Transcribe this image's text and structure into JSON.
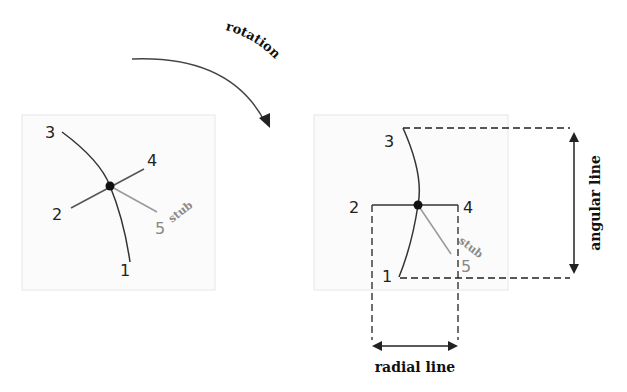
{
  "diagram": {
    "title_arrow_label": "rotation",
    "colors": {
      "line": "#333333",
      "stub_line": "#999999",
      "box_border": "#e6e6e6",
      "box_fill": "#fbfbfb",
      "dashed": "#222222"
    },
    "left_panel": {
      "labels": {
        "p1": "1",
        "p2": "2",
        "p3": "3",
        "p4": "4",
        "p5": "5",
        "stub": "stub"
      }
    },
    "right_panel": {
      "labels": {
        "p1": "1",
        "p2": "2",
        "p3": "3",
        "p4": "4",
        "p5": "5",
        "stub": "stub"
      },
      "dimension_labels": {
        "angular": "angular line",
        "radial": "radial line"
      }
    }
  }
}
